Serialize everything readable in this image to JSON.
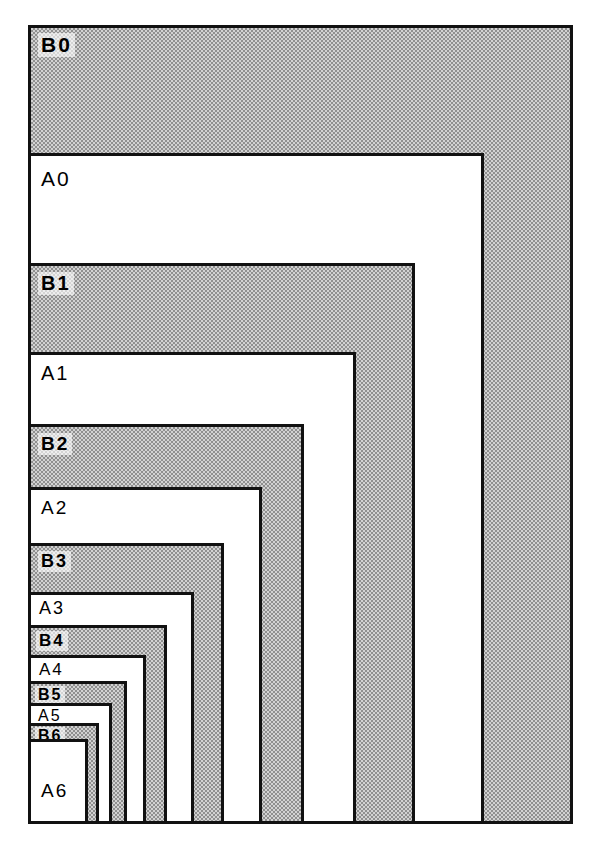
{
  "figure": {
    "title_partial": "",
    "type": "nested-rectangles-diagram",
    "background_color": "#ffffff",
    "line_color": "#111111",
    "shaded_fill_color": "#d2d2d2",
    "shaded_fill_style": "halftone-dither",
    "unshaded_fill_color": "#ffffff"
  },
  "frame": {
    "left": 28,
    "top": 25,
    "right": 573,
    "bottom": 824
  },
  "sheets": [
    {
      "label": "B0",
      "series": "B",
      "index": 0,
      "shaded": true,
      "left": 28,
      "top": 25,
      "width": 545,
      "height": 799,
      "label_x": 38,
      "label_y": 33,
      "label_size": "sz-0"
    },
    {
      "label": "A0",
      "series": "A",
      "index": 0,
      "shaded": false,
      "left": 28,
      "top": 153,
      "width": 456,
      "height": 671,
      "label_x": 38,
      "label_y": 167,
      "label_size": "sz-0"
    },
    {
      "label": "B1",
      "series": "B",
      "index": 1,
      "shaded": true,
      "left": 28,
      "top": 263,
      "width": 387,
      "height": 561,
      "label_x": 38,
      "label_y": 272,
      "label_size": "sz-1"
    },
    {
      "label": "A1",
      "series": "A",
      "index": 1,
      "shaded": false,
      "left": 28,
      "top": 352,
      "width": 328,
      "height": 472,
      "label_x": 38,
      "label_y": 362,
      "label_size": "sz-1"
    },
    {
      "label": "B2",
      "series": "B",
      "index": 2,
      "shaded": true,
      "left": 28,
      "top": 424,
      "width": 276,
      "height": 400,
      "label_x": 38,
      "label_y": 433,
      "label_size": "sz-2"
    },
    {
      "label": "A2",
      "series": "A",
      "index": 2,
      "shaded": false,
      "left": 28,
      "top": 487,
      "width": 234,
      "height": 337,
      "label_x": 38,
      "label_y": 497,
      "label_size": "sz-2"
    },
    {
      "label": "B3",
      "series": "B",
      "index": 3,
      "shaded": true,
      "left": 28,
      "top": 543,
      "width": 196,
      "height": 281,
      "label_x": 38,
      "label_y": 551,
      "label_size": "sz-3"
    },
    {
      "label": "A3",
      "series": "A",
      "index": 3,
      "shaded": false,
      "left": 28,
      "top": 592,
      "width": 166,
      "height": 232,
      "label_x": 36,
      "label_y": 598,
      "label_size": "sz-3"
    },
    {
      "label": "B4",
      "series": "B",
      "index": 4,
      "shaded": true,
      "left": 28,
      "top": 625,
      "width": 139,
      "height": 199,
      "label_x": 36,
      "label_y": 631,
      "label_size": "sz-4"
    },
    {
      "label": "A4",
      "series": "A",
      "index": 4,
      "shaded": false,
      "left": 28,
      "top": 655,
      "width": 118,
      "height": 169,
      "label_x": 36,
      "label_y": 660,
      "label_size": "sz-4"
    },
    {
      "label": "B5",
      "series": "B",
      "index": 5,
      "shaded": true,
      "left": 28,
      "top": 681,
      "width": 99,
      "height": 143,
      "label_x": 35,
      "label_y": 686,
      "label_size": "sz-5"
    },
    {
      "label": "A5",
      "series": "A",
      "index": 5,
      "shaded": false,
      "left": 28,
      "top": 703,
      "width": 84,
      "height": 121,
      "label_x": 35,
      "label_y": 707,
      "label_size": "sz-5"
    },
    {
      "label": "B6",
      "series": "B",
      "index": 6,
      "shaded": true,
      "left": 28,
      "top": 723,
      "width": 71,
      "height": 101,
      "label_x": 35,
      "label_y": 727,
      "label_size": "sz-6"
    },
    {
      "label": "A6",
      "series": "A",
      "index": 6,
      "shaded": false,
      "left": 28,
      "top": 739,
      "width": 60,
      "height": 85,
      "label_x": 38,
      "label_y": 780,
      "label_size": "sz-a6"
    }
  ]
}
